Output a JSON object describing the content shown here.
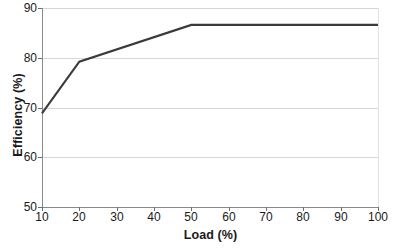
{
  "chart_data": {
    "type": "line",
    "title": "",
    "xlabel": "Load (%)",
    "ylabel": "Efficiency (%)",
    "x": [
      10,
      20,
      50,
      100
    ],
    "series": [
      {
        "name": "Efficiency",
        "values": [
          68.8,
          79.2,
          86.6,
          86.6
        ],
        "color": "#3a3a3a"
      }
    ],
    "xlim": [
      10,
      100
    ],
    "ylim": [
      50,
      90
    ],
    "xticks": [
      10,
      20,
      30,
      40,
      50,
      60,
      70,
      80,
      90,
      100
    ],
    "yticks": [
      50,
      60,
      70,
      80,
      90
    ],
    "xtick_labels": [
      "10",
      "20",
      "30",
      "40",
      "50",
      "60",
      "70",
      "80",
      "90",
      "100"
    ],
    "ytick_labels": [
      "50",
      "60",
      "70",
      "80",
      "90"
    ],
    "grid": "horizontal",
    "legend": "none",
    "gridline_color": "#d7d7d7",
    "axis_color": "#8a8a8a",
    "background": "#ffffff"
  }
}
